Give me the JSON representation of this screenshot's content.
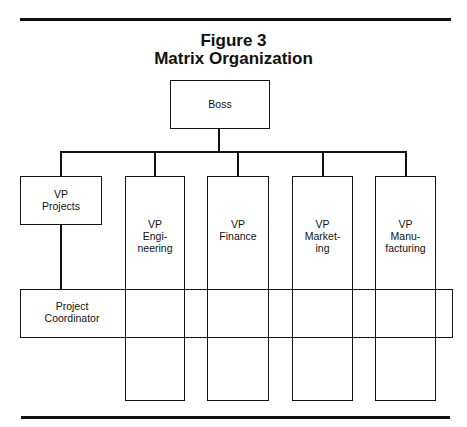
{
  "figure": {
    "number": "Figure 3",
    "title": "Matrix Organization"
  },
  "nodes": {
    "boss": {
      "label": "Boss"
    },
    "vp_projects": {
      "line1": "VP",
      "line2": "Projects"
    },
    "vp_engineering": {
      "line1": "VP",
      "line2": "Engi-",
      "line3": "neering"
    },
    "vp_finance": {
      "line1": "VP",
      "line2": "Finance"
    },
    "vp_marketing": {
      "line1": "VP",
      "line2": "Market-",
      "line3": "ing"
    },
    "vp_manufacturing": {
      "line1": "VP",
      "line2": "Manu-",
      "line3": "facturing"
    },
    "project_coordinator": {
      "line1": "Project",
      "line2": "Coordinator"
    }
  },
  "colors": {
    "line": "#111111",
    "background": "#ffffff"
  }
}
